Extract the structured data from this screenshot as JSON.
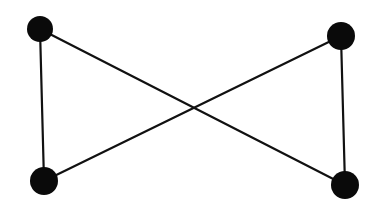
{
  "diagram": {
    "type": "graph",
    "colors": {
      "background": "#ffffff",
      "edge": "#111111",
      "node": "#0a0a0a"
    },
    "nodes": [
      {
        "id": "top-left",
        "label": ""
      },
      {
        "id": "top-right",
        "label": ""
      },
      {
        "id": "bottom-left",
        "label": ""
      },
      {
        "id": "bottom-right",
        "label": ""
      }
    ],
    "edges": [
      {
        "from": "top-left",
        "to": "bottom-left"
      },
      {
        "from": "top-right",
        "to": "bottom-right"
      },
      {
        "from": "top-left",
        "to": "bottom-right"
      },
      {
        "from": "bottom-left",
        "to": "top-right"
      }
    ]
  }
}
